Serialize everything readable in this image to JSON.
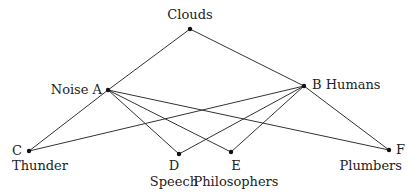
{
  "diagram": {
    "type": "lattice-graph",
    "nodes": [
      {
        "id": "clouds",
        "label": "Clouds",
        "x": 190,
        "y": 29
      },
      {
        "id": "A",
        "label": "Noise A",
        "x": 108,
        "y": 90
      },
      {
        "id": "B",
        "label": "B Humans",
        "x": 304,
        "y": 86
      },
      {
        "id": "C",
        "letter": "C",
        "label": "Thunder",
        "x": 29,
        "y": 151
      },
      {
        "id": "D",
        "letter": "D",
        "label": "Speech",
        "x": 179,
        "y": 154
      },
      {
        "id": "E",
        "letter": "E",
        "label": "Philosophers",
        "x": 231,
        "y": 152
      },
      {
        "id": "F",
        "letter": "F",
        "label": "Plumbers",
        "x": 389,
        "y": 150
      }
    ],
    "edges": [
      [
        "clouds",
        "A"
      ],
      [
        "clouds",
        "B"
      ],
      [
        "A",
        "C"
      ],
      [
        "A",
        "D"
      ],
      [
        "A",
        "E"
      ],
      [
        "A",
        "F"
      ],
      [
        "B",
        "C"
      ],
      [
        "B",
        "D"
      ],
      [
        "B",
        "E"
      ],
      [
        "B",
        "F"
      ]
    ]
  },
  "labels": {
    "clouds": "Clouds",
    "noise_a": "Noise A",
    "b_humans": "B Humans",
    "c": "C",
    "thunder": "Thunder",
    "d": "D",
    "speech": "Speech",
    "e": "E",
    "philosophers": "Philosophers",
    "f": "F",
    "plumbers": "Plumbers"
  }
}
